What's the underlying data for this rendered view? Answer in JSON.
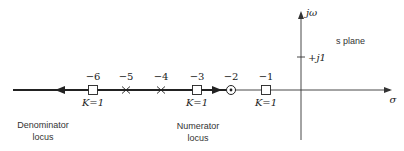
{
  "diagram": {
    "type": "root-locus",
    "plane_label": "s plane",
    "axes": {
      "real_label": "σ",
      "imag_label": "jω",
      "imag_tick_label": "+j1"
    },
    "real_axis_points": [
      {
        "value": -6,
        "label": "−6",
        "marker": "square",
        "k_label": "K=1"
      },
      {
        "value": -5,
        "label": "−5",
        "marker": "x"
      },
      {
        "value": -4,
        "label": "−4",
        "marker": "x"
      },
      {
        "value": -3,
        "label": "−3",
        "marker": "square",
        "k_label": "K=1"
      },
      {
        "value": -2,
        "label": "−2",
        "marker": "circled-dot"
      },
      {
        "value": -1,
        "label": "−1",
        "marker": "square",
        "k_label": "K=1"
      }
    ],
    "loci": [
      {
        "name": "Denominator locus",
        "line1": "Denominator",
        "line2": "locus",
        "from": -4,
        "to": "-infinity",
        "direction": "left"
      },
      {
        "name": "Numerator locus",
        "line1": "Numerator",
        "line2": "locus",
        "from": -4,
        "to": -2,
        "direction": "right"
      }
    ]
  }
}
